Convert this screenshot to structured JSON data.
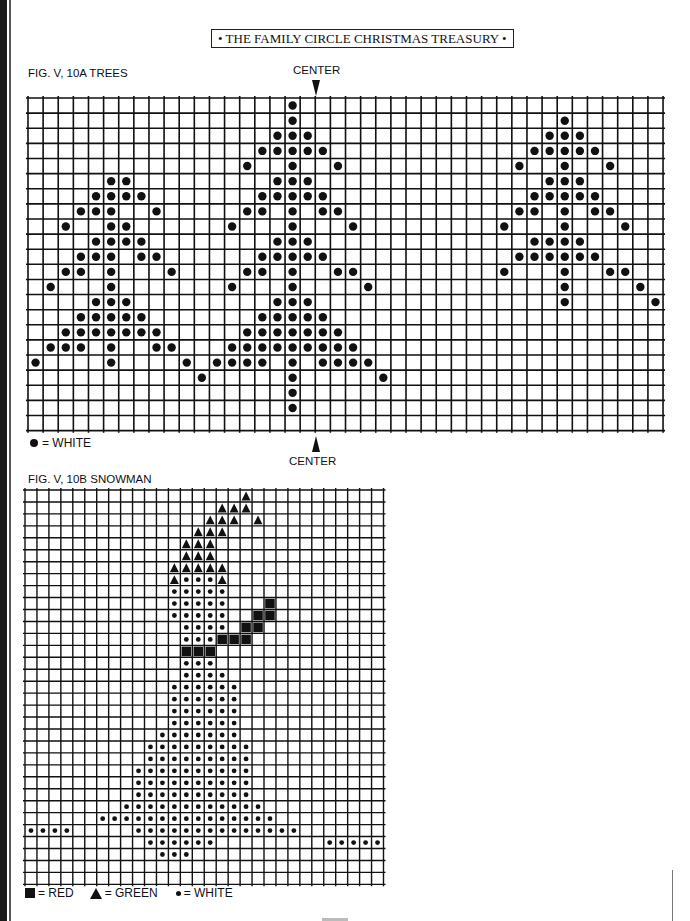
{
  "header": {
    "title": "• THE FAMILY CIRCLE CHRISTMAS TREASURY •"
  },
  "trees": {
    "fig_label": "FIG. V, 10A   TREES",
    "center_top": "CENTER",
    "center_bottom": "CENTER",
    "legend": {
      "dot": "= WHITE"
    },
    "grid": {
      "cols": 42,
      "rows": 22,
      "left": 28,
      "top": 98,
      "cell": 15.12,
      "center_col": 19
    },
    "dots": [
      [
        0,
        17
      ],
      [
        1,
        17
      ],
      [
        1,
        35
      ],
      [
        2,
        16
      ],
      [
        2,
        17
      ],
      [
        2,
        18
      ],
      [
        2,
        34
      ],
      [
        2,
        35
      ],
      [
        2,
        36
      ],
      [
        3,
        15
      ],
      [
        3,
        16
      ],
      [
        3,
        17
      ],
      [
        3,
        18
      ],
      [
        3,
        19
      ],
      [
        3,
        33
      ],
      [
        3,
        34
      ],
      [
        3,
        35
      ],
      [
        3,
        36
      ],
      [
        3,
        37
      ],
      [
        4,
        14
      ],
      [
        4,
        17
      ],
      [
        4,
        20
      ],
      [
        4,
        32
      ],
      [
        4,
        35
      ],
      [
        4,
        38
      ],
      [
        5,
        5
      ],
      [
        5,
        6
      ],
      [
        5,
        16
      ],
      [
        5,
        17
      ],
      [
        5,
        18
      ],
      [
        5,
        34
      ],
      [
        5,
        35
      ],
      [
        5,
        36
      ],
      [
        6,
        4
      ],
      [
        6,
        5
      ],
      [
        6,
        6
      ],
      [
        6,
        7
      ],
      [
        6,
        15
      ],
      [
        6,
        16
      ],
      [
        6,
        17
      ],
      [
        6,
        18
      ],
      [
        6,
        19
      ],
      [
        6,
        33
      ],
      [
        6,
        34
      ],
      [
        6,
        35
      ],
      [
        6,
        36
      ],
      [
        6,
        37
      ],
      [
        7,
        3
      ],
      [
        7,
        4
      ],
      [
        7,
        5
      ],
      [
        7,
        8
      ],
      [
        7,
        14
      ],
      [
        7,
        15
      ],
      [
        7,
        17
      ],
      [
        7,
        19
      ],
      [
        7,
        20
      ],
      [
        7,
        32
      ],
      [
        7,
        33
      ],
      [
        7,
        35
      ],
      [
        7,
        37
      ],
      [
        7,
        38
      ],
      [
        8,
        2
      ],
      [
        8,
        5
      ],
      [
        8,
        6
      ],
      [
        8,
        13
      ],
      [
        8,
        17
      ],
      [
        8,
        21
      ],
      [
        8,
        31
      ],
      [
        8,
        35
      ],
      [
        8,
        39
      ],
      [
        9,
        4
      ],
      [
        9,
        5
      ],
      [
        9,
        6
      ],
      [
        9,
        7
      ],
      [
        9,
        16
      ],
      [
        9,
        17
      ],
      [
        9,
        18
      ],
      [
        9,
        33
      ],
      [
        9,
        34
      ],
      [
        9,
        35
      ],
      [
        9,
        36
      ],
      [
        10,
        3
      ],
      [
        10,
        4
      ],
      [
        10,
        5
      ],
      [
        10,
        7
      ],
      [
        10,
        8
      ],
      [
        10,
        15
      ],
      [
        10,
        16
      ],
      [
        10,
        17
      ],
      [
        10,
        18
      ],
      [
        10,
        19
      ],
      [
        10,
        32
      ],
      [
        10,
        33
      ],
      [
        10,
        34
      ],
      [
        10,
        35
      ],
      [
        10,
        36
      ],
      [
        10,
        37
      ],
      [
        11,
        2
      ],
      [
        11,
        3
      ],
      [
        11,
        5
      ],
      [
        11,
        9
      ],
      [
        11,
        14
      ],
      [
        11,
        15
      ],
      [
        11,
        17
      ],
      [
        11,
        20
      ],
      [
        11,
        21
      ],
      [
        11,
        31
      ],
      [
        11,
        35
      ],
      [
        11,
        38
      ],
      [
        11,
        39
      ],
      [
        12,
        1
      ],
      [
        12,
        5
      ],
      [
        12,
        13
      ],
      [
        12,
        17
      ],
      [
        12,
        22
      ],
      [
        12,
        35
      ],
      [
        12,
        40
      ],
      [
        13,
        4
      ],
      [
        13,
        5
      ],
      [
        13,
        6
      ],
      [
        13,
        16
      ],
      [
        13,
        17
      ],
      [
        13,
        18
      ],
      [
        13,
        35
      ],
      [
        13,
        41
      ],
      [
        14,
        3
      ],
      [
        14,
        4
      ],
      [
        14,
        5
      ],
      [
        14,
        6
      ],
      [
        14,
        7
      ],
      [
        14,
        15
      ],
      [
        14,
        16
      ],
      [
        14,
        17
      ],
      [
        14,
        18
      ],
      [
        14,
        19
      ],
      [
        15,
        2
      ],
      [
        15,
        3
      ],
      [
        15,
        4
      ],
      [
        15,
        5
      ],
      [
        15,
        6
      ],
      [
        15,
        7
      ],
      [
        15,
        8
      ],
      [
        15,
        14
      ],
      [
        15,
        15
      ],
      [
        15,
        16
      ],
      [
        15,
        17
      ],
      [
        15,
        18
      ],
      [
        15,
        19
      ],
      [
        15,
        20
      ],
      [
        16,
        1
      ],
      [
        16,
        2
      ],
      [
        16,
        3
      ],
      [
        16,
        5
      ],
      [
        16,
        8
      ],
      [
        16,
        9
      ],
      [
        16,
        13
      ],
      [
        16,
        14
      ],
      [
        16,
        15
      ],
      [
        16,
        16
      ],
      [
        16,
        17
      ],
      [
        16,
        18
      ],
      [
        16,
        19
      ],
      [
        16,
        20
      ],
      [
        16,
        21
      ],
      [
        17,
        0
      ],
      [
        17,
        5
      ],
      [
        17,
        10
      ],
      [
        17,
        12
      ],
      [
        17,
        13
      ],
      [
        17,
        14
      ],
      [
        17,
        15
      ],
      [
        17,
        17
      ],
      [
        17,
        19
      ],
      [
        17,
        20
      ],
      [
        17,
        21
      ],
      [
        17,
        22
      ],
      [
        18,
        11
      ],
      [
        18,
        17
      ],
      [
        18,
        23
      ],
      [
        19,
        17
      ],
      [
        20,
        17
      ]
    ]
  },
  "snowman": {
    "fig_label": "FIG. V, 10B   SNOWMAN",
    "legend": {
      "red": "= RED",
      "green": "= GREEN",
      "white": "= WHITE"
    },
    "grid": {
      "cols": 30,
      "rows": 33,
      "left": 25,
      "top": 490,
      "cell": 11.95
    },
    "triangles": [
      [
        0,
        18
      ],
      [
        1,
        16
      ],
      [
        1,
        17
      ],
      [
        1,
        18
      ],
      [
        2,
        15
      ],
      [
        2,
        16
      ],
      [
        2,
        17
      ],
      [
        2,
        19
      ],
      [
        3,
        14
      ],
      [
        3,
        15
      ],
      [
        3,
        16
      ],
      [
        4,
        13
      ],
      [
        4,
        14
      ],
      [
        4,
        15
      ],
      [
        5,
        13
      ],
      [
        5,
        14
      ],
      [
        5,
        15
      ],
      [
        6,
        12
      ],
      [
        6,
        13
      ],
      [
        6,
        14
      ],
      [
        6,
        15
      ],
      [
        6,
        16
      ],
      [
        7,
        12
      ],
      [
        7,
        16
      ]
    ],
    "squares": [
      [
        9,
        20
      ],
      [
        10,
        19
      ],
      [
        10,
        20
      ],
      [
        11,
        18
      ],
      [
        11,
        19
      ],
      [
        12,
        16
      ],
      [
        12,
        17
      ],
      [
        12,
        18
      ],
      [
        13,
        13
      ],
      [
        13,
        14
      ],
      [
        13,
        15
      ]
    ],
    "dot_rows": [
      {
        "row": 7,
        "ranges": [
          [
            13,
            15
          ]
        ]
      },
      {
        "row": 8,
        "ranges": [
          [
            12,
            16
          ]
        ]
      },
      {
        "row": 9,
        "ranges": [
          [
            12,
            16
          ]
        ]
      },
      {
        "row": 10,
        "ranges": [
          [
            12,
            16
          ]
        ]
      },
      {
        "row": 11,
        "ranges": [
          [
            13,
            16
          ]
        ]
      },
      {
        "row": 12,
        "ranges": [
          [
            13,
            15
          ]
        ]
      },
      {
        "row": 14,
        "ranges": [
          [
            13,
            15
          ]
        ]
      },
      {
        "row": 15,
        "ranges": [
          [
            13,
            16
          ]
        ]
      },
      {
        "row": 16,
        "ranges": [
          [
            12,
            17
          ]
        ]
      },
      {
        "row": 17,
        "ranges": [
          [
            12,
            17
          ]
        ]
      },
      {
        "row": 18,
        "ranges": [
          [
            12,
            17
          ]
        ]
      },
      {
        "row": 19,
        "ranges": [
          [
            12,
            17
          ]
        ]
      },
      {
        "row": 20,
        "ranges": [
          [
            11,
            17
          ]
        ]
      },
      {
        "row": 21,
        "ranges": [
          [
            10,
            18
          ]
        ]
      },
      {
        "row": 22,
        "ranges": [
          [
            10,
            18
          ]
        ]
      },
      {
        "row": 23,
        "ranges": [
          [
            9,
            18
          ]
        ]
      },
      {
        "row": 24,
        "ranges": [
          [
            9,
            18
          ]
        ]
      },
      {
        "row": 25,
        "ranges": [
          [
            9,
            18
          ]
        ]
      },
      {
        "row": 26,
        "ranges": [
          [
            8,
            19
          ]
        ]
      },
      {
        "row": 27,
        "ranges": [
          [
            6,
            20
          ]
        ]
      },
      {
        "row": 28,
        "ranges": [
          [
            0,
            3
          ],
          [
            9,
            22
          ]
        ]
      },
      {
        "row": 29,
        "ranges": [
          [
            10,
            15
          ],
          [
            25,
            29
          ]
        ]
      },
      {
        "row": 30,
        "ranges": [
          [
            11,
            13
          ]
        ]
      }
    ]
  }
}
